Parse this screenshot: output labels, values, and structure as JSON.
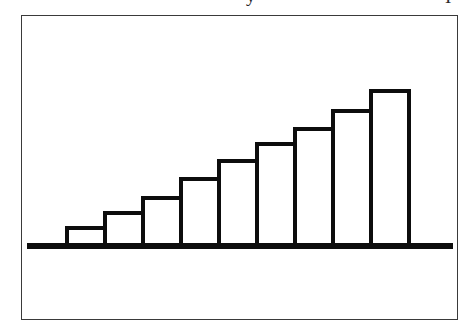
{
  "figure": {
    "kind": "scanned-line-art-bar-chart",
    "frame": {
      "border_color": "#3a3a3a",
      "background_color": "#ffffff"
    },
    "ink_color": "#0d0d0d",
    "top_text_remnants": [
      {
        "name": "descender-remnant-left",
        "text": "y"
      },
      {
        "name": "descender-remnant-right",
        "text": "I"
      }
    ]
  },
  "chart_data": {
    "type": "bar",
    "title": "",
    "subtitle": "",
    "xlabel": "",
    "ylabel": "",
    "categories": [
      "1",
      "2",
      "3",
      "4",
      "5",
      "6",
      "7",
      "8",
      "9"
    ],
    "values": [
      18,
      33,
      48,
      67,
      85,
      102,
      117,
      135,
      155
    ],
    "ylim": [
      0,
      170
    ],
    "grid": false,
    "legend": null,
    "legend_position": "none",
    "axis_tick_labels_x": [],
    "axis_tick_labels_y": [],
    "annotations": [],
    "style": {
      "bar_fill": "#ffffff",
      "bar_outline": "#0d0d0d",
      "bar_outline_width_px": 4,
      "baseline_width_px": 6,
      "bars_contiguous": true
    },
    "geometry": {
      "baseline_y_px": 230,
      "baseline_x_start_px": 5,
      "baseline_x_end_px": 431,
      "bar_x_start_px": 45,
      "bar_width_px": 38,
      "bar_count": 9,
      "tops_y_px": [
        212,
        197,
        182,
        163,
        145,
        128,
        113,
        95,
        75
      ]
    }
  }
}
